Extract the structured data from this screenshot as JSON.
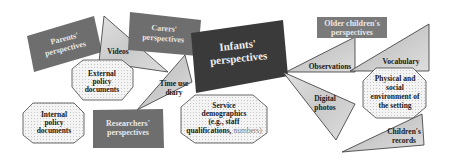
{
  "diagram": {
    "central": {
      "label_lines": [
        "Infants'",
        "perspectives"
      ],
      "shape": "rectangle",
      "fill": "#3a3a3a"
    },
    "perspective_boxes": [
      {
        "id": "parents",
        "label_lines": [
          "Parents'",
          "perspectives"
        ],
        "fill": "#6e6e6e"
      },
      {
        "id": "carers",
        "label_lines": [
          "Carers'",
          "perspectives"
        ],
        "fill": "#6e6e6e"
      },
      {
        "id": "researchers",
        "label_lines": [
          "Researchers'",
          "perspectives"
        ],
        "fill": "#6e6e6e"
      },
      {
        "id": "older-children",
        "label_lines": [
          "Older children's",
          "perspectives"
        ],
        "fill": "#7a7a7a"
      }
    ],
    "method_triangles": [
      {
        "id": "videos",
        "label": "Videos"
      },
      {
        "id": "time-use-diary",
        "label_lines": [
          "Time use",
          "diary"
        ]
      },
      {
        "id": "observations",
        "label": "Observations"
      },
      {
        "id": "digital-photos",
        "label_lines": [
          "Digital",
          "photos"
        ]
      },
      {
        "id": "vocabulary",
        "label": "Vocabulary"
      },
      {
        "id": "childrens-records",
        "label_lines": [
          "Children's",
          "records"
        ]
      }
    ],
    "context_octagons": [
      {
        "id": "external-policy",
        "label_lines": [
          "External",
          "policy",
          "documents"
        ]
      },
      {
        "id": "internal-policy",
        "label_lines": [
          "Internal",
          "policy",
          "documents"
        ]
      },
      {
        "id": "service-demographics",
        "label_lines": [
          "Service",
          "demographics",
          "(e.g., staff",
          "qualifications,"
        ],
        "label_suffix": "numbers)"
      },
      {
        "id": "physical-social",
        "label_lines": [
          "Physical and",
          "social",
          "environment of",
          "the setting"
        ]
      }
    ]
  }
}
